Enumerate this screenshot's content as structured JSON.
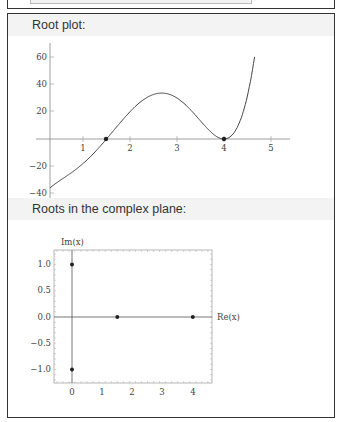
{
  "pods": [
    {
      "title": "Root plot:"
    },
    {
      "title": "Roots in the complex plane:"
    }
  ],
  "chart_data": [
    {
      "type": "line",
      "title": "Root plot",
      "xlabel": "",
      "ylabel": "",
      "xlim": [
        0.3,
        5.3
      ],
      "ylim": [
        -42,
        66
      ],
      "xticks": [
        1,
        2,
        3,
        4,
        5
      ],
      "yticks": [
        -40,
        -20,
        20,
        40,
        60
      ],
      "series": [
        {
          "name": "f(x)",
          "x_range": [
            0.3,
            4.65
          ],
          "shape": "rises from -40 at x=0.3, crosses 0 at x=1.5, local max ~33 at x~2.7, touches 0 at x=4, rises to ~65 at x~4.65"
        }
      ],
      "roots": [
        {
          "x": 1.5,
          "y": 0
        },
        {
          "x": 4,
          "y": 0
        }
      ]
    },
    {
      "type": "scatter",
      "title": "Roots in the complex plane",
      "xlabel": "Re(x)",
      "ylabel": "Im(x)",
      "xlim": [
        -0.6,
        4.6
      ],
      "ylim": [
        -1.3,
        1.3
      ],
      "xticks": [
        0,
        1,
        2,
        3,
        4
      ],
      "yticks": [
        1.0,
        0.5,
        0.0,
        -0.5,
        -1.0
      ],
      "points": [
        {
          "re": 0,
          "im": 1
        },
        {
          "re": 0,
          "im": -1
        },
        {
          "re": 1.5,
          "im": 0
        },
        {
          "re": 4,
          "im": 0
        }
      ]
    }
  ],
  "labels": {
    "root_xticks": [
      "1",
      "2",
      "3",
      "4",
      "5"
    ],
    "root_yticks": [
      "60",
      "40",
      "20",
      "−20",
      "−40"
    ],
    "cx_xticks": [
      "0",
      "1",
      "2",
      "3",
      "4"
    ],
    "cx_yticks": [
      "1.0",
      "0.5",
      "0.0",
      "−0.5",
      "−1.0"
    ],
    "cx_xlabel": "Re(x)",
    "cx_ylabel": "Im(x)"
  }
}
